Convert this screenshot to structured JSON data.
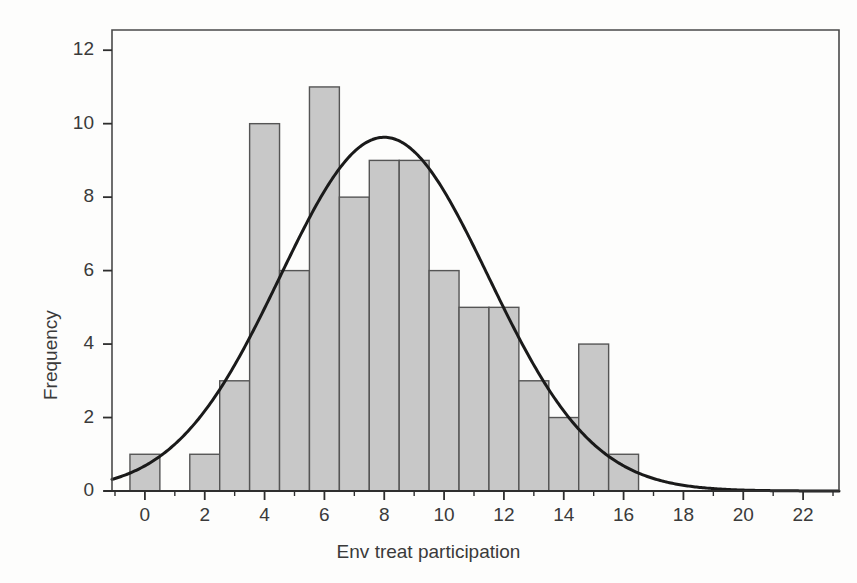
{
  "chart_data": {
    "type": "bar",
    "title": "",
    "subtitle": "",
    "xlabel": "Env treat participation",
    "ylabel": "Frequency",
    "categories": [
      0,
      1,
      2,
      3,
      4,
      5,
      6,
      7,
      8,
      9,
      10,
      11,
      12,
      13,
      14,
      15,
      16
    ],
    "values": [
      1,
      0,
      1,
      3,
      10,
      6,
      11,
      8,
      9,
      9,
      6,
      5,
      5,
      3,
      2,
      4,
      1
    ],
    "bar_width": 1,
    "bar_fill": "#c8c8c8",
    "bar_stroke": "#555555",
    "xlim": [
      -1.1,
      23.2
    ],
    "ylim": [
      0,
      12.55
    ],
    "xticks": [
      0,
      2,
      4,
      6,
      8,
      10,
      12,
      14,
      16,
      18,
      20,
      22
    ],
    "xtick_labels": [
      "0",
      "2",
      "4",
      "6",
      "8",
      "10",
      "12",
      "14",
      "16",
      "18",
      "20",
      "22"
    ],
    "xticks_minor": [
      -1,
      1,
      3,
      5,
      7,
      9,
      11,
      13,
      15,
      17,
      19,
      21,
      23
    ],
    "yticks": [
      0,
      2,
      4,
      6,
      8,
      10,
      12
    ],
    "ytick_labels": [
      "0",
      "2",
      "4",
      "6",
      "8",
      "10",
      "12"
    ],
    "grid": false,
    "legend": "none",
    "overlay_curve": {
      "name": "normal-fit",
      "kind": "normal-density-scaled",
      "mean": 8.0,
      "std_dev": 3.48,
      "peak_value": 9.6,
      "n": 84,
      "bin_width": 1,
      "stroke": "#1a1a1a",
      "stroke_width": 3
    },
    "annotations": []
  }
}
